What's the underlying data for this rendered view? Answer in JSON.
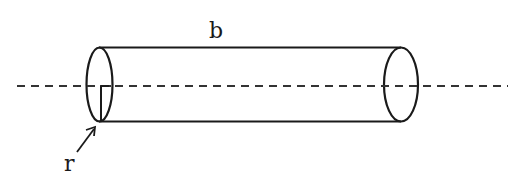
{
  "diagram": {
    "type": "cylinder",
    "labels": {
      "length": "b",
      "radius": "r"
    },
    "colors": {
      "stroke": "#1a1a1a",
      "background": "#ffffff"
    },
    "elements": [
      "axis-dashed-line",
      "cylinder-body",
      "left-end-ellipse",
      "right-end-ellipse",
      "radius-line",
      "radius-arrow"
    ]
  }
}
